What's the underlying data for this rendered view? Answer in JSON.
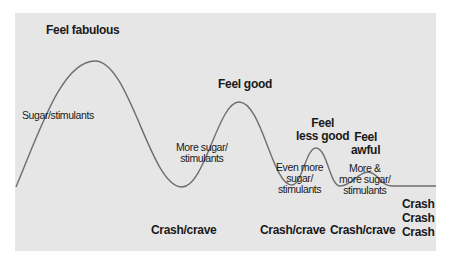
{
  "diagram": {
    "colors": {
      "panel": "#e6e6e6",
      "curve": "#6e6e6e",
      "text": "#1a1a1a"
    },
    "peaks": [
      {
        "label": [
          "Feel fabulous"
        ],
        "trigger": [
          "Sugar/stimulants"
        ],
        "crash": [
          "Crash/crave"
        ]
      },
      {
        "label": [
          "Feel good"
        ],
        "trigger": [
          "More sugar/",
          "stimulants"
        ],
        "crash": [
          "Crash/crave"
        ]
      },
      {
        "label": [
          "Feel",
          "less good"
        ],
        "trigger": [
          "Even more",
          "sugar/",
          "stimulants"
        ],
        "crash": [
          "Crash/crave"
        ]
      },
      {
        "label": [
          "Feel",
          "awful"
        ],
        "trigger": [
          "More &",
          "more sugar/",
          "stimulants"
        ],
        "crash": [
          "Crash",
          "Crash",
          "Crash"
        ]
      }
    ]
  }
}
